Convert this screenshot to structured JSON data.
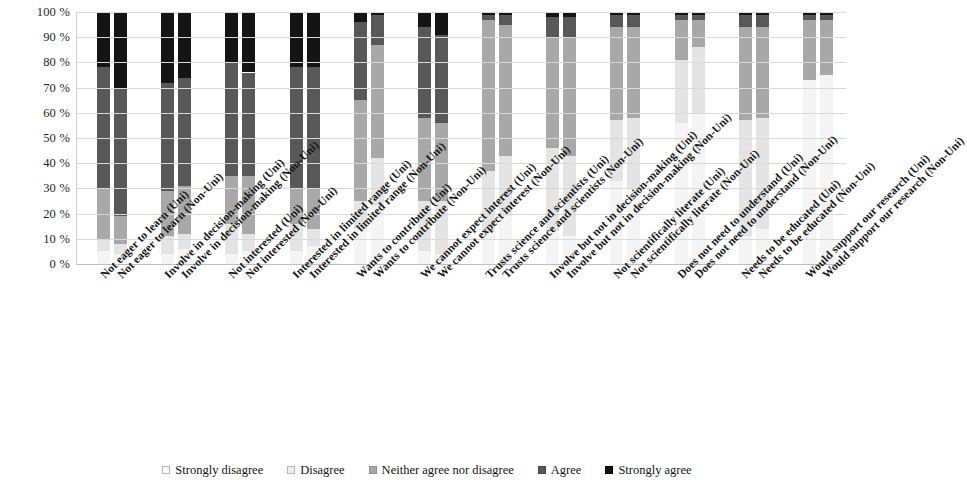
{
  "chart_data": {
    "type": "bar",
    "subtype": "stacked-100-percent",
    "title": "",
    "xlabel": "",
    "ylabel": "",
    "ylim": [
      0,
      100
    ],
    "y_ticks": [
      "0 %",
      "10 %",
      "20 %",
      "30 %",
      "40 %",
      "50 %",
      "60 %",
      "70 %",
      "80 %",
      "90 %",
      "100 %"
    ],
    "grid": true,
    "legend_position": "bottom",
    "legend": [
      "Strongly disagree",
      "Disagree",
      "Neither agree nor disagree",
      "Agree",
      "Strongly agree"
    ],
    "series_colors": [
      "#f4f4f4",
      "#e4e4e4",
      "#a8a8a8",
      "#585858",
      "#141414"
    ],
    "groups": [
      "Not eager to learn",
      "Involve in decision-making",
      "Not interested",
      "Interested in limited range",
      "Wants to contribute",
      "We cannot expect interest",
      "Trusts science and scientists",
      "Involve but not in decision-making",
      "Not scientifically literate",
      "Does not need to understand",
      "Needs to be educated",
      "Would support our research"
    ],
    "group_suffixes": [
      "(Uni)",
      "(Non-Uni)"
    ],
    "categories": [
      "Not eager to learn (Uni)",
      "Not eager to learn (Non-Uni)",
      "Involve in decision-making (Uni)",
      "Involve in decision-making (Non-Uni)",
      "Not interested (Uni)",
      "Not interested (Non-Uni)",
      "Interested in limited range (Uni)",
      "Interested in limited range (Non-Uni)",
      "Wants to contribute (Uni)",
      "Wants to contribute (Non-Uni)",
      "We cannot expect interest (Uni)",
      "We cannot expect interest (Non-Uni)",
      "Trusts science and scientists (Uni)",
      "Trusts science and scientists (Non-Uni)",
      "Involve but not in decision-making (Uni)",
      "Involve but not in decision-making (Non-Uni)",
      "Not scientifically literate (Uni)",
      "Not scientifically literate (Non-Uni)",
      "Does not need to understand (Uni)",
      "Does not need to understand (Non-Uni)",
      "Needs to be educated (Uni)",
      "Needs to be educated (Non-Uni)",
      "Would support our research (Uni)",
      "Would support our research (Non-Uni)"
    ],
    "series": [
      {
        "name": "Strongly disagree",
        "values": [
          5,
          4,
          4,
          6,
          4,
          5,
          5,
          7,
          14,
          23,
          5,
          4,
          13,
          19,
          13,
          11,
          33,
          30,
          56,
          60,
          11,
          14,
          73,
          75
        ]
      },
      {
        "name": "Disagree",
        "values": [
          5,
          4,
          7,
          6,
          12,
          7,
          11,
          7,
          11,
          19,
          20,
          21,
          24,
          24,
          33,
          32,
          24,
          28,
          25,
          26,
          46,
          44,
          0,
          0
        ]
      },
      {
        "name": "Neither agree nor disagree",
        "values": [
          20,
          11,
          18,
          19,
          19,
          23,
          14,
          16,
          40,
          45,
          33,
          31,
          60,
          52,
          44,
          47,
          37,
          36,
          16,
          11,
          37,
          36,
          24,
          22
        ]
      },
      {
        "name": "Agree",
        "values": [
          48,
          51,
          43,
          43,
          45,
          41,
          48,
          48,
          31,
          12,
          36,
          35,
          2,
          4,
          8,
          8,
          5,
          5,
          2,
          2,
          5,
          5,
          2,
          2
        ]
      },
      {
        "name": "Strongly agree",
        "values": [
          22,
          30,
          28,
          26,
          20,
          24,
          22,
          22,
          4,
          1,
          6,
          9,
          1,
          1,
          2,
          2,
          1,
          1,
          1,
          1,
          1,
          1,
          1,
          1
        ]
      }
    ]
  }
}
